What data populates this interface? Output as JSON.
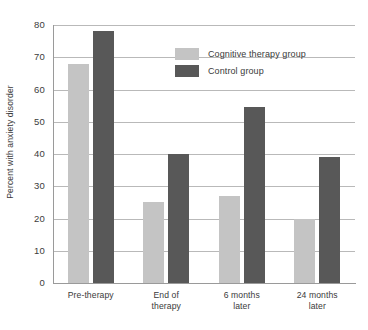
{
  "chart_data": {
    "type": "bar",
    "title": "",
    "xlabel": "",
    "ylabel": "Percent with anxiety disorder",
    "ylim": [
      0,
      80
    ],
    "yticks": [
      0,
      10,
      20,
      30,
      40,
      50,
      60,
      70,
      80
    ],
    "grid": true,
    "legend_position": "top-center",
    "categories": [
      "Pre-therapy",
      "End of therapy",
      "6 months later",
      "24 months later"
    ],
    "category_lines": [
      [
        "Pre-therapy"
      ],
      [
        "End of",
        "therapy"
      ],
      [
        "6 months",
        "later"
      ],
      [
        "24 months",
        "later"
      ]
    ],
    "series": [
      {
        "name": "Cognitive therapy group",
        "color": "#c4c4c4",
        "values": [
          68,
          25,
          27,
          20
        ]
      },
      {
        "name": "Control group",
        "color": "#585858",
        "values": [
          78,
          40,
          54.5,
          39
        ]
      }
    ]
  }
}
